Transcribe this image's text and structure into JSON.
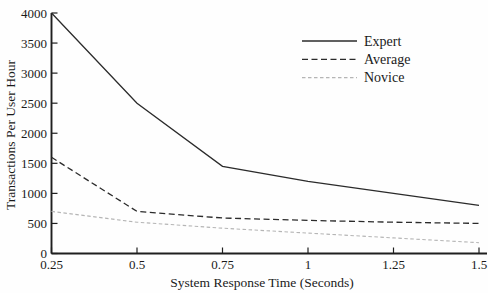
{
  "figure": {
    "background": "#fefefe",
    "axis_color": "#1f1f1f",
    "text_color": "#1a1a1a"
  },
  "chart_data": {
    "type": "line",
    "title": "",
    "xlabel": "System Response Time (Seconds)",
    "ylabel": "Transactions Per User Hour",
    "x": [
      0.25,
      0.5,
      0.75,
      1.0,
      1.25,
      1.5
    ],
    "xlim": [
      0.25,
      1.5
    ],
    "ylim": [
      0,
      4000
    ],
    "grid": false,
    "legend_position": "upper-right-inside",
    "xticks": {
      "values": [
        0.25,
        0.5,
        0.75,
        1.0,
        1.25,
        1.5
      ],
      "labels": [
        "0.25",
        "0.5",
        "0.75",
        "1",
        "1.25",
        "1.5"
      ]
    },
    "yticks": {
      "values": [
        0,
        500,
        1000,
        1500,
        2000,
        2500,
        3000,
        3500,
        4000
      ],
      "labels": [
        "0",
        "500",
        "1000",
        "1500",
        "2000",
        "2500",
        "3000",
        "3500",
        "4000"
      ]
    },
    "series": [
      {
        "name": "Expert",
        "values": [
          4000,
          2500,
          1450,
          1200,
          1000,
          800
        ],
        "color": "#2b2b2b",
        "dash": "solid",
        "width": 1.3
      },
      {
        "name": "Average",
        "values": [
          1600,
          700,
          590,
          550,
          520,
          500
        ],
        "color": "#2b2b2b",
        "dash": "dashed",
        "width": 1.3
      },
      {
        "name": "Novice",
        "values": [
          700,
          520,
          420,
          340,
          260,
          180
        ],
        "color": "#b5b5b5",
        "dash": "fine-dashed",
        "width": 1.1
      }
    ]
  }
}
